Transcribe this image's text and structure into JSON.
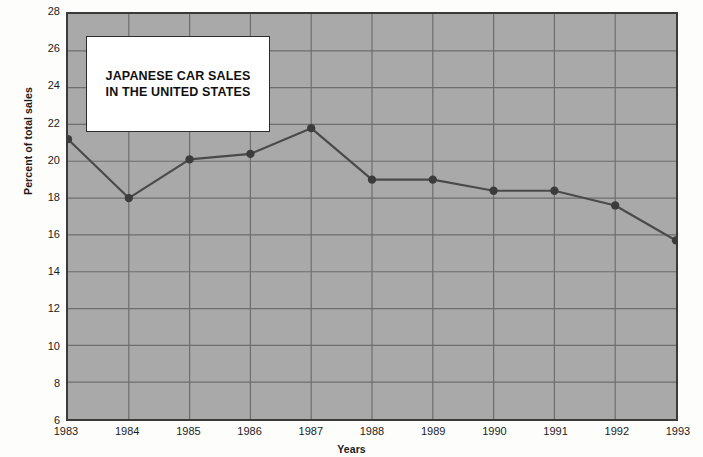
{
  "chart_data": {
    "type": "line",
    "title": "JAPANESE CAR SALES IN THE UNITED STATES",
    "title_line1": "JAPANESE CAR SALES",
    "title_line2": "IN THE UNITED STATES",
    "xlabel": "Years",
    "ylabel": "Percent of total sales",
    "categories": [
      "1983",
      "1984",
      "1985",
      "1986",
      "1987",
      "1988",
      "1989",
      "1990",
      "1991",
      "1992",
      "1993"
    ],
    "x": [
      1983,
      1984,
      1985,
      1986,
      1987,
      1988,
      1989,
      1990,
      1991,
      1992,
      1993
    ],
    "values": [
      21.2,
      18.0,
      20.1,
      20.4,
      21.8,
      19.0,
      19.0,
      18.4,
      18.4,
      17.6,
      15.7
    ],
    "series": [
      {
        "name": "Percent of total sales",
        "values": [
          21.2,
          18.0,
          20.1,
          20.4,
          21.8,
          19.0,
          19.0,
          18.4,
          18.4,
          17.6,
          15.7
        ]
      }
    ],
    "ylim": [
      6,
      28
    ],
    "yticks": [
      6,
      8,
      10,
      12,
      14,
      16,
      18,
      20,
      22,
      24,
      26,
      28
    ],
    "ytick_labels": [
      "6",
      "8",
      "10",
      "12",
      "14",
      "16",
      "18",
      "20",
      "22",
      "24",
      "26",
      "28"
    ],
    "xlim": [
      1983,
      1993
    ],
    "grid": true,
    "legend": null,
    "marker": "circle",
    "colors": {
      "plot_background": "#a9a9a9",
      "gridline": "#6e6e6e",
      "line": "#4a4a4a",
      "marker": "#3c3c3c",
      "axis_border": "#3a3a3a",
      "text": "#1b1b1b",
      "title_box_background": "#ffffff",
      "title_box_border": "#2b2b2b",
      "figure_background": "#fdfdfc"
    }
  }
}
